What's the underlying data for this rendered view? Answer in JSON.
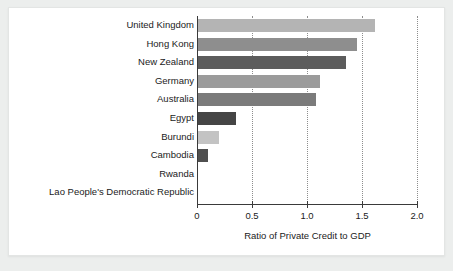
{
  "figure": {
    "background": "#ffffff",
    "page_background": "#eceeed",
    "border_color": "#e3e5e4"
  },
  "chart_data": {
    "type": "bar",
    "orientation": "horizontal",
    "title": "",
    "subtitle": "",
    "xlabel": "Ratio of Private Credit to GDP",
    "ylabel": "",
    "xlim": [
      0,
      2.0
    ],
    "xticks": [
      "0",
      "0.5",
      "1.0",
      "1.5",
      "2.0"
    ],
    "xtick_values": [
      0,
      0.5,
      1.0,
      1.5,
      2.0
    ],
    "grid": "vertical-dotted",
    "legend": "none",
    "categories": [
      "United Kingdom",
      "Hong Kong",
      "New Zealand",
      "Germany",
      "Australia",
      "Egypt",
      "Burundi",
      "Cambodia",
      "Rwanda",
      "Lao People's Democratic Republic"
    ],
    "values": [
      1.62,
      1.45,
      1.35,
      1.12,
      1.08,
      0.35,
      0.2,
      0.1,
      0.0,
      0.0
    ],
    "bar_colors": [
      "#b4b4b4",
      "#8e8e8e",
      "#5c5c5c",
      "#9b9b9b",
      "#7b7b7b",
      "#454545",
      "#c3c3c3",
      "#4f4f4f",
      "#9b9b9b",
      "#9b9b9b"
    ]
  }
}
